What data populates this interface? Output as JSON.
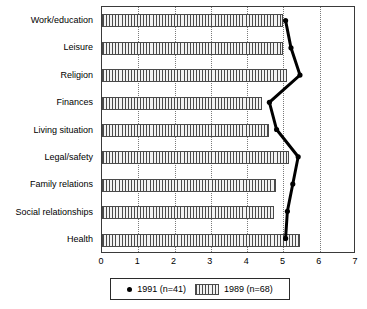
{
  "chart_data": {
    "type": "bar",
    "orientation": "horizontal",
    "title": "",
    "subtitle": "",
    "xlabel": "",
    "ylabel": "",
    "xlim": [
      0,
      7
    ],
    "xticks": [
      "0",
      "1",
      "2",
      "3",
      "4",
      "5",
      "6",
      "7"
    ],
    "grid": "vertical-dotted",
    "legend_position": "bottom-center",
    "categories": [
      "Work/education",
      "Leisure",
      "Religion",
      "Finances",
      "Living situation",
      "Legal/safety",
      "Family relations",
      "Social relationships",
      "Health"
    ],
    "series": [
      {
        "name": "1989 (n=68)",
        "marker": "hatched-bar",
        "render": "bar",
        "values": [
          5.0,
          5.0,
          5.1,
          4.4,
          4.6,
          5.15,
          4.8,
          4.75,
          5.45
        ]
      },
      {
        "name": "1991 (n=41)",
        "marker": "dot",
        "render": "line",
        "values": [
          5.1,
          5.25,
          5.5,
          4.65,
          4.85,
          5.45,
          5.3,
          5.15,
          5.1
        ]
      }
    ]
  },
  "legend": {
    "entries": [
      {
        "label": "1991 (n=41)",
        "icon": "dot-marker"
      },
      {
        "label": "1989 (n=68)",
        "icon": "hatched-swatch"
      }
    ]
  },
  "colors": {
    "bar_fill": "#f2f2f2",
    "bar_hatch": "#4a4a4a",
    "line": "#000000",
    "marker": "#000000",
    "axis": "#3a3a3a",
    "grid": "#7a7a7a",
    "background": "#ffffff"
  }
}
